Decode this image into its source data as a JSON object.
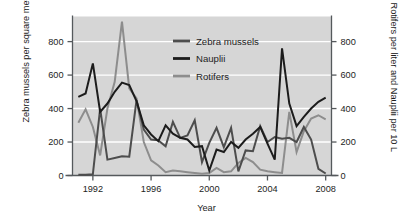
{
  "chart_data": {
    "type": "line",
    "title": "",
    "xlabel": "Year",
    "ylabel_left": "Zebra mussels per square meter",
    "ylabel_right": "Rotifers per liter and Nauplii per 10 L",
    "xlim": [
      1990.6,
      2008.4
    ],
    "ylim": [
      0,
      950
    ],
    "left_axis_ticks": [
      0,
      200,
      400,
      600,
      800
    ],
    "right_axis_ticks": [
      0,
      200,
      400,
      600,
      800
    ],
    "x_ticks": [
      1992,
      1996,
      2000,
      2004,
      2008
    ],
    "x_tick_labels": [
      "1992",
      "1996",
      "2000",
      "2004",
      "2008"
    ],
    "grid": "horizontal-white",
    "legend_position": "top-center-inside",
    "plot_background": "#d6d6d6",
    "series": [
      {
        "name": "Zebra mussels",
        "axis": "left",
        "color": "#4d4d4d",
        "x": [
          1991,
          1991.5,
          1992,
          1992.5,
          1993,
          1993.5,
          1994,
          1994.5,
          1995,
          1995.5,
          1996,
          1996.5,
          1997,
          1997.5,
          1998,
          1998.5,
          1999,
          1999.5,
          2000,
          2000.5,
          2001,
          2001.5,
          2002,
          2002.5,
          2003,
          2003.5,
          2004,
          2004.5,
          2005,
          2005.5,
          2006,
          2006.5,
          2007,
          2007.5,
          2008
        ],
        "values": [
          5,
          5,
          8,
          400,
          95,
          105,
          115,
          112,
          450,
          275,
          215,
          210,
          175,
          320,
          225,
          240,
          330,
          80,
          195,
          285,
          170,
          285,
          25,
          150,
          145,
          295,
          200,
          230,
          220,
          225,
          200,
          290,
          215,
          40,
          12
        ]
      },
      {
        "name": "Nauplii",
        "axis": "right",
        "color": "#1c1c1c",
        "x": [
          1991,
          1991.5,
          1992,
          1992.5,
          1993,
          1993.5,
          1994,
          1994.5,
          1995,
          1995.5,
          1996,
          1996.5,
          1997,
          1997.5,
          1998,
          1998.5,
          1999,
          1999.5,
          2000,
          2000.5,
          2001,
          2001.5,
          2002,
          2002.5,
          2003,
          2003.5,
          2004,
          2004.5,
          2005,
          2005.5,
          2006,
          2006.5,
          2007,
          2007.5,
          2008
        ],
        "values": [
          470,
          490,
          670,
          380,
          430,
          500,
          555,
          540,
          445,
          300,
          245,
          205,
          300,
          250,
          225,
          215,
          170,
          175,
          30,
          155,
          140,
          200,
          165,
          215,
          250,
          290,
          190,
          95,
          760,
          430,
          295,
          350,
          400,
          440,
          465
        ]
      },
      {
        "name": "Rotifers",
        "axis": "right",
        "color": "#8d8d8d",
        "x": [
          1991,
          1991.5,
          1992,
          1992.5,
          1993,
          1993.5,
          1994,
          1994.5,
          1995,
          1995.5,
          1996,
          1996.5,
          1997,
          1997.5,
          1998,
          1998.5,
          1999,
          1999.5,
          2000,
          2000.5,
          2001,
          2001.5,
          2002,
          2002.5,
          2003,
          2003.5,
          2004,
          2004.5,
          2005,
          2005.5,
          2006,
          2006.5,
          2007,
          2007.5,
          2008
        ],
        "values": [
          315,
          395,
          290,
          120,
          400,
          560,
          920,
          520,
          460,
          200,
          90,
          60,
          20,
          30,
          25,
          20,
          15,
          10,
          15,
          45,
          20,
          25,
          75,
          105,
          80,
          35,
          25,
          20,
          15,
          380,
          140,
          265,
          340,
          360,
          335
        ]
      }
    ],
    "legend_entries": [
      {
        "label": "Zebra mussels",
        "color": "#4d4d4d"
      },
      {
        "label": "Nauplii",
        "color": "#1c1c1c"
      },
      {
        "label": "Rotifers",
        "color": "#8d8d8d"
      }
    ]
  }
}
